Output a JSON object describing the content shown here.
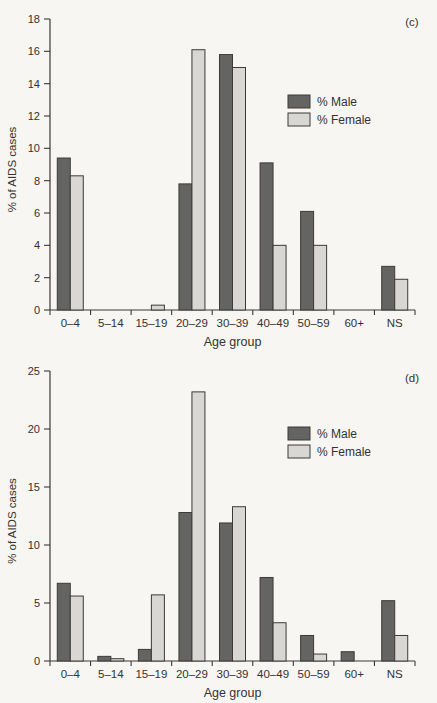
{
  "figure": {
    "background_color": "#f7f6f2",
    "axis_color": "#3a3938",
    "text_color": "#333231",
    "bar_outline_color": "#3c3b3a"
  },
  "chart_data": [
    {
      "type": "bar",
      "panel_label": "(c)",
      "title": "",
      "xlabel": "Age group",
      "ylabel": "% of AIDS cases",
      "ylim": [
        0,
        18
      ],
      "ytick_step": 2,
      "grid": false,
      "legend_position": "upper-right-inside",
      "categories": [
        "0–4",
        "5–14",
        "15–19",
        "20–29",
        "30–39",
        "40–49",
        "50–59",
        "60+",
        "NS"
      ],
      "series": [
        {
          "name": "% Male",
          "color": "#646463",
          "values": [
            9.4,
            0,
            0,
            7.8,
            15.8,
            9.1,
            6.1,
            0,
            2.7
          ]
        },
        {
          "name": "% Female",
          "color": "#d8d7d3",
          "values": [
            8.3,
            0,
            0.3,
            16.1,
            15.0,
            4.0,
            4.0,
            0,
            1.9
          ]
        }
      ]
    },
    {
      "type": "bar",
      "panel_label": "(d)",
      "title": "",
      "xlabel": "Age group",
      "ylabel": "% of AIDS cases",
      "ylim": [
        0,
        25
      ],
      "ytick_step": 5,
      "grid": false,
      "legend_position": "upper-right-inside",
      "categories": [
        "0–4",
        "5–14",
        "15–19",
        "20–29",
        "30–39",
        "40–49",
        "50–59",
        "60+",
        "NS"
      ],
      "series": [
        {
          "name": "% Male",
          "color": "#646463",
          "values": [
            6.7,
            0.4,
            1.0,
            12.8,
            11.9,
            7.2,
            2.2,
            0.8,
            5.2
          ]
        },
        {
          "name": "% Female",
          "color": "#d8d7d3",
          "values": [
            5.6,
            0.2,
            5.7,
            23.2,
            13.3,
            3.3,
            0.6,
            0,
            2.2
          ]
        }
      ]
    }
  ]
}
